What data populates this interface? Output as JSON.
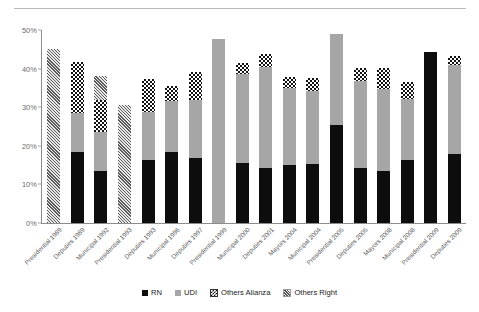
{
  "chart_data": {
    "type": "bar",
    "stacked": true,
    "title": "",
    "subtitle": "",
    "xlabel": "",
    "ylabel": "",
    "ylim": [
      0,
      50
    ],
    "ytick_labels": [
      "0%",
      "10%",
      "20%",
      "30%",
      "40%",
      "50%"
    ],
    "ytick_values": [
      0,
      10,
      20,
      30,
      40,
      50
    ],
    "grid": false,
    "legend_position": "bottom",
    "categories": [
      "Presidential 1989",
      "Deputies 1989",
      "Municipal 1992",
      "Presidential 1993",
      "Deputies 1993",
      "Municipal 1996",
      "Deputies 1997",
      "Presidential 1999",
      "Municipal 2000",
      "Deputies 2001",
      "Mayors 2004",
      "Municipal 2004",
      "Presidential 2005",
      "Deputies 2005",
      "Mayors 2008",
      "Municipal 2008",
      "Presidential 2009",
      "Deputies 2009"
    ],
    "series": [
      {
        "name": "RN",
        "color": "#0d0d0d",
        "pattern": "solid-black",
        "values": [
          0,
          18.4,
          13.5,
          0,
          16.4,
          18.5,
          16.8,
          0,
          15.6,
          14.2,
          15.0,
          15.3,
          25.4,
          14.2,
          13.6,
          16.2,
          44.3,
          18.0
        ]
      },
      {
        "name": "UDI",
        "color": "#a6a6a6",
        "pattern": "solid-gray",
        "values": [
          0,
          10.2,
          10.0,
          0,
          12.4,
          13.2,
          15.0,
          47.8,
          23.0,
          26.3,
          20.0,
          19.0,
          23.5,
          22.5,
          21.2,
          16.0,
          0,
          23.0
        ]
      },
      {
        "name": "Others Alianza",
        "color": "#111111",
        "pattern": "checkerboard",
        "values": [
          0,
          13.0,
          8.3,
          0,
          8.6,
          3.8,
          7.4,
          0,
          2.9,
          3.2,
          2.8,
          3.4,
          0,
          3.5,
          5.3,
          4.3,
          0,
          2.3
        ]
      },
      {
        "name": "Others Right",
        "color": "#5a5a5a",
        "pattern": "diagonal-hatch",
        "values": [
          45.0,
          0,
          6.2,
          30.6,
          0,
          0,
          0,
          0,
          0,
          0,
          0,
          0,
          0,
          0,
          0,
          0,
          0,
          0
        ]
      }
    ]
  },
  "legend": {
    "items": [
      {
        "label": "RN",
        "swatch": "rn"
      },
      {
        "label": "UDI",
        "swatch": "udi"
      },
      {
        "label": "Others Alianza",
        "swatch": "alianza"
      },
      {
        "label": "Others Right",
        "swatch": "right"
      }
    ]
  }
}
